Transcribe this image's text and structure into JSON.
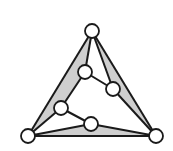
{
  "diagram": {
    "type": "graph",
    "colors": {
      "stroke": "#1a1a1a",
      "fill_region": "#cfcfcf",
      "node_fill": "#ffffff",
      "background": "#ffffff"
    },
    "node_radius": 7,
    "nodes": [
      {
        "id": "T",
        "x": 92,
        "y": 31
      },
      {
        "id": "A",
        "x": 85,
        "y": 72
      },
      {
        "id": "B",
        "x": 113,
        "y": 89
      },
      {
        "id": "C",
        "x": 61,
        "y": 108
      },
      {
        "id": "D",
        "x": 91,
        "y": 124
      },
      {
        "id": "BL",
        "x": 28,
        "y": 136
      },
      {
        "id": "BR",
        "x": 156,
        "y": 136
      }
    ],
    "edges": [
      [
        "T",
        "BL"
      ],
      [
        "T",
        "BR"
      ],
      [
        "BL",
        "BR"
      ],
      [
        "T",
        "A"
      ],
      [
        "A",
        "B"
      ],
      [
        "T",
        "B"
      ],
      [
        "B",
        "BR"
      ],
      [
        "A",
        "C"
      ],
      [
        "C",
        "BL"
      ],
      [
        "C",
        "D"
      ],
      [
        "D",
        "BL"
      ],
      [
        "D",
        "BR"
      ]
    ],
    "shaded_regions": [
      [
        "T",
        "A",
        "C",
        "BL"
      ],
      [
        "T",
        "B",
        "BR"
      ],
      [
        "BL",
        "D",
        "BR"
      ]
    ]
  }
}
